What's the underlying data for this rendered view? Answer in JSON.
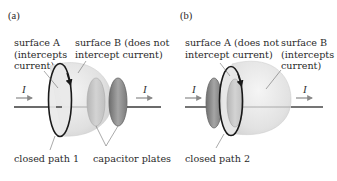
{
  "figure": {
    "panel_a": {
      "label": "(a)",
      "surface_a_lines": [
        "surface A",
        "(intercepts",
        "current)"
      ],
      "surface_b_lines": [
        "surface B (does not",
        "intercept current)"
      ],
      "path_label": "closed path 1",
      "plates_label": "capacitor plates",
      "current_in": "I",
      "current_out": "I"
    },
    "panel_b": {
      "label": "(b)",
      "surface_a_lines": [
        "surface A (does not",
        "intercept current)"
      ],
      "surface_b_lines": [
        "surface B",
        "(intercepts",
        "current)"
      ],
      "path_label": "closed path 2",
      "current_in": "I",
      "current_out": "I"
    },
    "colors": {
      "wire": "#3a3a3a",
      "arrow": "#8a8a8a",
      "surface_fill": "#e4e4e4",
      "plate_light": "#c8c8c8",
      "plate_dark": "#8e8e8e",
      "loop": "#1a1a1a"
    }
  }
}
